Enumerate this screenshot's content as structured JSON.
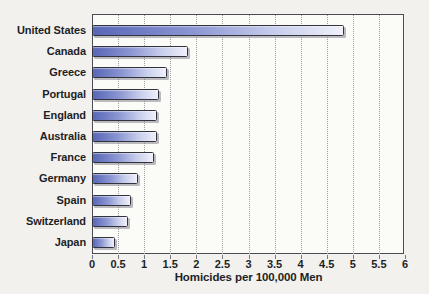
{
  "chart_data": {
    "type": "bar",
    "orientation": "horizontal",
    "title": "",
    "xlabel": "Homicides per 100,000 Men",
    "ylabel": "",
    "categories": [
      "United States",
      "Canada",
      "Greece",
      "Portugal",
      "England",
      "Australia",
      "France",
      "Germany",
      "Spain",
      "Switzerland",
      "Japan"
    ],
    "values": [
      4.8,
      1.8,
      1.4,
      1.25,
      1.2,
      1.2,
      1.15,
      0.85,
      0.7,
      0.65,
      0.4
    ],
    "xlim": [
      0,
      6
    ],
    "x_tick_values": [
      0,
      0.5,
      1,
      1.5,
      2,
      2.5,
      3,
      3.5,
      4,
      4.5,
      5,
      5.5,
      6
    ],
    "x_tick_labels": [
      "0",
      "0.5",
      "1",
      "1.5",
      "2",
      "2.5",
      "3",
      "3.5",
      "4",
      "4.5",
      "5",
      "5.5",
      "6"
    ],
    "grid": "vertical-dotted-every-0.5",
    "legend": "none"
  },
  "style": {
    "background": "#f2f1ee",
    "plot_background": "#fbfbf8",
    "plot_border": "#4c4c54",
    "gridline_color": "#9c9ca2",
    "bar_gradient_left": "#5866b6",
    "bar_gradient_mid1": "#8b96d2",
    "bar_gradient_mid2": "#c6cceb",
    "bar_gradient_right": "#f0f1fb",
    "bar_border": "#33333b",
    "text_color": "#1e1f24"
  }
}
